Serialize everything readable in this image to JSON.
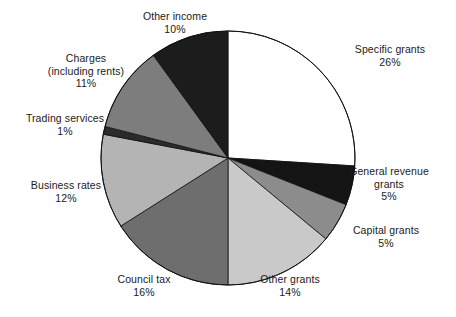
{
  "chart_data": {
    "type": "pie",
    "title": "",
    "subtitle": "",
    "unit": "%",
    "start_angle_deg": 0,
    "direction": "clockwise",
    "legend": "none",
    "labels_position": "outside",
    "categories": [
      "Specific grants",
      "General revenue grants",
      "Capital grants",
      "Other grants",
      "Council tax",
      "Business rates",
      "Trading services",
      "Charges (including rents)",
      "Other income"
    ],
    "values": [
      26,
      5,
      5,
      14,
      16,
      12,
      1,
      11,
      10
    ],
    "colors": [
      "#ffffff",
      "#141414",
      "#8c8c8c",
      "#c9c9c9",
      "#6e6e6e",
      "#b4b4b4",
      "#2b2b2b",
      "#7d7d7d",
      "#1c1c1c"
    ],
    "slices": [
      {
        "name": "Specific grants",
        "value": 26,
        "color": "#ffffff"
      },
      {
        "name": "General revenue grants",
        "value": 5,
        "color": "#141414"
      },
      {
        "name": "Capital grants",
        "value": 5,
        "color": "#8c8c8c"
      },
      {
        "name": "Other grants",
        "value": 14,
        "color": "#c9c9c9"
      },
      {
        "name": "Council tax",
        "value": 16,
        "color": "#6e6e6e"
      },
      {
        "name": "Business rates",
        "value": 12,
        "color": "#b4b4b4"
      },
      {
        "name": "Trading services",
        "value": 1,
        "color": "#2b2b2b"
      },
      {
        "name": "Charges (including rents)",
        "value": 11,
        "color": "#7d7d7d"
      },
      {
        "name": "Other income",
        "value": 10,
        "color": "#1c1c1c"
      }
    ]
  },
  "labels": {
    "specific_grants": {
      "name": "Specific grants",
      "pct": "26%"
    },
    "general_revenue": {
      "line1": "General revenue",
      "line2": "grants",
      "pct": "5%"
    },
    "capital_grants": {
      "name": "Capital grants",
      "pct": "5%"
    },
    "other_grants": {
      "name": "Other grants",
      "pct": "14%"
    },
    "council_tax": {
      "name": "Council tax",
      "pct": "16%"
    },
    "business_rates": {
      "name": "Business rates",
      "pct": "12%"
    },
    "trading_services": {
      "name": "Trading services",
      "pct": "1%"
    },
    "charges": {
      "line1": "Charges",
      "line2": "(including rents)",
      "pct": "11%"
    },
    "other_income": {
      "name": "Other income",
      "pct": "10%"
    }
  },
  "geometry": {
    "center_x": 228,
    "center_y": 158,
    "radius": 127
  }
}
